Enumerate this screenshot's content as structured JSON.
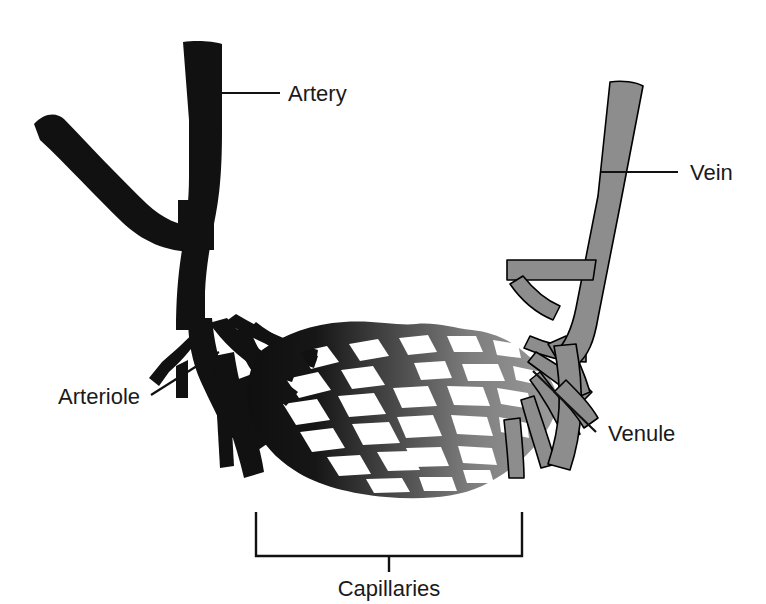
{
  "figure": {
    "background_color": "#ffffff"
  },
  "colors": {
    "artery": "#111111",
    "vein": "#8d8d8d",
    "vein_outline": "#000000",
    "capillary_arterial_end": "#141414",
    "capillary_venous_end": "#9a9a9a",
    "text": "#1a1a1a",
    "leader_line": "#111111"
  },
  "labels": {
    "artery": "Artery",
    "vein": "Vein",
    "arteriole": "Arteriole",
    "venule": "Venule",
    "capillaries": "Capillaries"
  },
  "structures": [
    {
      "name": "artery",
      "label": "Artery",
      "color": "#111111",
      "side": "left",
      "description": "Large black branching vessel entering from upper left"
    },
    {
      "name": "arteriole",
      "label": "Arteriole",
      "color": "#111111",
      "side": "left",
      "description": "Small black branches feeding the capillary bed"
    },
    {
      "name": "capillaries",
      "label": "Capillaries",
      "color": "gradient black to gray",
      "side": "center",
      "description": "Diamond mesh network spanning between arteriole and venule"
    },
    {
      "name": "venule",
      "label": "Venule",
      "color": "#8d8d8d",
      "side": "right",
      "description": "Small gray branches draining the capillary bed"
    },
    {
      "name": "vein",
      "label": "Vein",
      "color": "#8d8d8d",
      "side": "right",
      "description": "Large gray vessel exiting to the upper right"
    }
  ]
}
